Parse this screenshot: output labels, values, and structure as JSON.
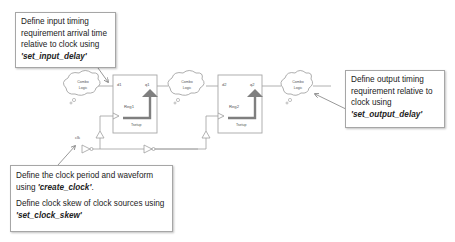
{
  "notes": {
    "input_delay": {
      "text": "Define input timing requirement arrival time relative to clock using ",
      "command": "'set_input_delay'"
    },
    "output_delay": {
      "text": "Define output timing requirement relative to clock using ",
      "command": "'set_output_delay'"
    },
    "clock": {
      "line1_text": "Define the clock period and waveform using ",
      "line1_command": "'create_clock'",
      "line1_suffix": ".",
      "line2_text": "Define clock skew of clock sources using ",
      "line2_command": "'set_clock_skew'"
    }
  },
  "circuit": {
    "combo_logic_label_1": "Combo",
    "combo_logic_label_2": "Logic",
    "reg1": {
      "name": "Reg1",
      "d": "d1",
      "q": "q1",
      "timing": "Tsetup"
    },
    "reg2": {
      "name": "Reg2",
      "d": "d2",
      "q": "q2",
      "timing": "Tsetup"
    },
    "clock_label": "clk"
  },
  "colors": {
    "wire": "#b0b0b0",
    "box_border": "#a6a6a6",
    "arrow": "#7f7f7f",
    "cloud": "#999999"
  }
}
